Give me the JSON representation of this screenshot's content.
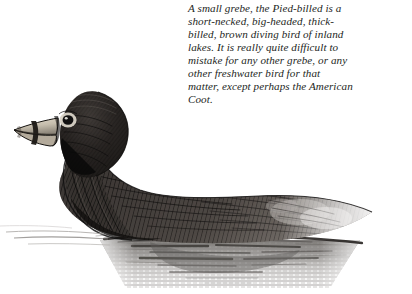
{
  "illustration": {
    "subject_name": "pied-billed-grebe",
    "style": "pen-and-ink stipple engraving",
    "palette": {
      "background": "#ffffff",
      "plumage_dark": "#1b1917",
      "plumage_mid": "#4a4542",
      "plumage_light": "#8d8782",
      "bill_pale": "#cfc7b8",
      "bill_band": "#201d1a",
      "eye_ring": "#d8d2c6",
      "eye_pupil": "#111010",
      "water_gray": "#8e8b88",
      "water_line": "#2a2725"
    },
    "parts": [
      {
        "name": "head",
        "label": "head"
      },
      {
        "name": "bill",
        "label": "thick pale bill with dark band"
      },
      {
        "name": "eye",
        "label": "eye with pale ring"
      },
      {
        "name": "neck",
        "label": "short neck"
      },
      {
        "name": "breast",
        "label": "breast"
      },
      {
        "name": "back",
        "label": "back and flank"
      },
      {
        "name": "rear",
        "label": "mottled rear flank"
      },
      {
        "name": "waterline",
        "label": "waterline"
      },
      {
        "name": "reflection",
        "label": "water reflection"
      }
    ]
  },
  "caption": {
    "full_text": "A small grebe, the Pied-billed is a short-necked, big-headed, thick-billed, brown diving bird of inland lakes. It is really quite difficult to mistake for any other grebe, or any other freshwater bird for that matter, except perhaps the American Coot.",
    "lines": [
      "A small grebe, the Pied-billed is a",
      "short-necked, big-headed, thick-",
      "billed, brown diving bird of inland",
      "lakes. It is really quite difficult to",
      "mistake for any other grebe, or any",
      "other freshwater bird for that",
      "matter, except perhaps the American",
      "Coot."
    ]
  }
}
